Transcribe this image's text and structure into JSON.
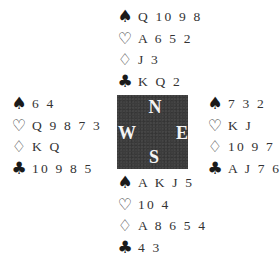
{
  "diagram": {
    "type": "bridge-deal",
    "suit_icons": {
      "spades": "♠",
      "hearts": "♡",
      "diamonds": "♢",
      "clubs": "♣"
    },
    "compass": {
      "north": "N",
      "west": "W",
      "east": "E",
      "south": "S",
      "box_color": "#3c3c3c",
      "letter_color": "#f4f4f4"
    },
    "hands": {
      "north": {
        "spades": "Q 10 9 8",
        "hearts": "A 6 5 2",
        "diamonds": "J 3",
        "clubs": "K Q 2"
      },
      "west": {
        "spades": "6 4",
        "hearts": "Q 9 8 7 3",
        "diamonds": "K Q",
        "clubs": "10 9 8 5"
      },
      "east": {
        "spades": "7 3 2",
        "hearts": "K J",
        "diamonds": "10 9 7 2",
        "clubs": "A J 7 6"
      },
      "south": {
        "spades": "A K J 5",
        "hearts": "10 4",
        "diamonds": "A 8 6 5 4",
        "clubs": "4 3"
      }
    }
  }
}
